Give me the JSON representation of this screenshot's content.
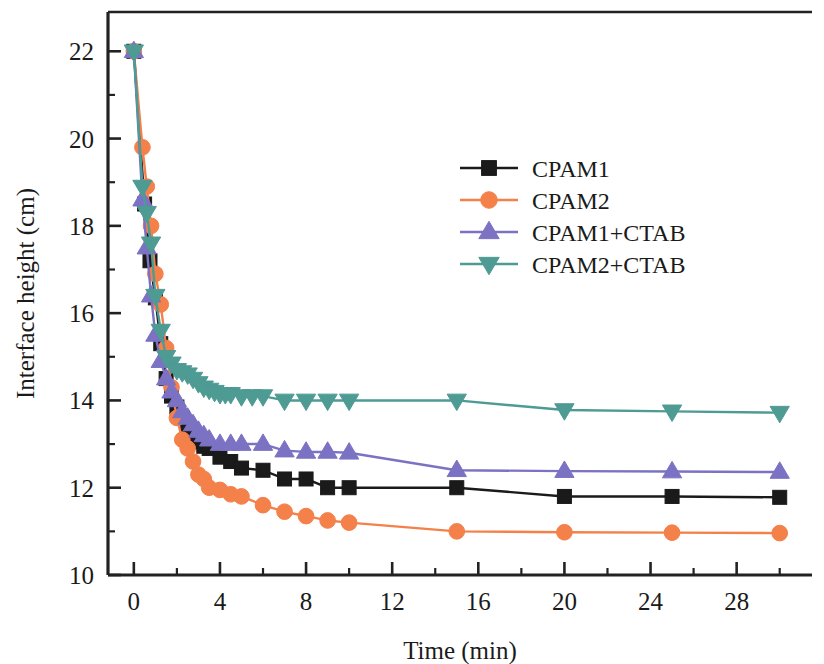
{
  "chart_data": {
    "type": "line",
    "title": "",
    "xlabel": "Time (min)",
    "ylabel": "Interface height (cm)",
    "xlim": [
      -1.2,
      31.5
    ],
    "ylim": [
      10,
      22.9
    ],
    "xticks": [
      0,
      4,
      8,
      12,
      16,
      20,
      24,
      28
    ],
    "yticks": [
      10,
      12,
      14,
      16,
      18,
      20,
      22
    ],
    "xtick_labels": [
      "0",
      "4",
      "8",
      "12",
      "16",
      "20",
      "24",
      "28"
    ],
    "ytick_labels": [
      "10",
      "12",
      "14",
      "16",
      "18",
      "20",
      "22"
    ],
    "xminor_step": 2,
    "yminor_step": 1,
    "grid": false,
    "legend_position": "upper center",
    "series": [
      {
        "name": "CPAM1",
        "color": "#1a1a1a",
        "marker": "square",
        "x": [
          0,
          0.5,
          0.75,
          1.0,
          1.25,
          1.5,
          1.75,
          2.0,
          2.25,
          2.5,
          2.75,
          3.0,
          3.25,
          3.5,
          4.0,
          4.5,
          5.0,
          6.0,
          7.0,
          8.0,
          9.0,
          10.0,
          15.0,
          20.0,
          25.0,
          30.0
        ],
        "y": [
          22.0,
          18.5,
          17.2,
          16.35,
          15.3,
          14.5,
          14.1,
          13.85,
          13.6,
          13.4,
          13.2,
          13.05,
          12.95,
          12.9,
          12.7,
          12.6,
          12.45,
          12.4,
          12.2,
          12.2,
          12.0,
          12.0,
          12.0,
          11.8,
          11.8,
          11.78
        ]
      },
      {
        "name": "CPAM2",
        "color": "#F4804A",
        "marker": "circle",
        "x": [
          0,
          0.4,
          0.6,
          0.8,
          1.0,
          1.25,
          1.5,
          1.75,
          2.0,
          2.25,
          2.5,
          2.75,
          3.0,
          3.25,
          3.5,
          4.0,
          4.5,
          5.0,
          6.0,
          7.0,
          8.0,
          9.0,
          10.0,
          15.0,
          20.0,
          25.0,
          30.0
        ],
        "y": [
          22.0,
          19.8,
          18.9,
          18.0,
          16.9,
          16.2,
          15.2,
          14.3,
          13.6,
          13.1,
          12.9,
          12.6,
          12.3,
          12.2,
          12.0,
          11.95,
          11.85,
          11.8,
          11.6,
          11.45,
          11.35,
          11.25,
          11.2,
          11.0,
          10.98,
          10.97,
          10.96
        ]
      },
      {
        "name": "CPAM1+CTAB",
        "color": "#7B72C4",
        "marker": "triangle-up",
        "x": [
          0,
          0.4,
          0.6,
          0.8,
          1.0,
          1.25,
          1.5,
          1.75,
          2.0,
          2.25,
          2.5,
          2.75,
          3.0,
          3.25,
          3.5,
          4.0,
          4.5,
          5.0,
          6.0,
          7.0,
          8.0,
          9.0,
          10.0,
          15.0,
          20.0,
          25.0,
          30.0
        ],
        "y": [
          22.0,
          18.6,
          17.5,
          16.4,
          15.5,
          14.9,
          14.5,
          14.2,
          14.0,
          13.75,
          13.6,
          13.45,
          13.3,
          13.2,
          13.1,
          13.0,
          13.0,
          13.0,
          13.0,
          12.85,
          12.82,
          12.82,
          12.8,
          12.4,
          12.38,
          12.37,
          12.36
        ]
      },
      {
        "name": "CPAM2+CTAB",
        "color": "#4E9B94",
        "marker": "triangle-down",
        "x": [
          0,
          0.4,
          0.6,
          0.8,
          1.0,
          1.25,
          1.5,
          1.75,
          2.0,
          2.25,
          2.5,
          2.75,
          3.0,
          3.25,
          3.5,
          3.75,
          4.0,
          4.25,
          4.5,
          5.0,
          5.5,
          6.0,
          7.0,
          8.0,
          9.0,
          10.0,
          15.0,
          20.0,
          25.0,
          30.0
        ],
        "y": [
          22.0,
          18.9,
          18.3,
          17.6,
          16.4,
          15.6,
          15.0,
          14.85,
          14.7,
          14.65,
          14.6,
          14.5,
          14.4,
          14.3,
          14.25,
          14.2,
          14.15,
          14.15,
          14.15,
          14.1,
          14.1,
          14.1,
          14.0,
          14.0,
          14.0,
          14.0,
          14.0,
          13.78,
          13.75,
          13.72
        ]
      }
    ]
  },
  "legend": {
    "items": [
      {
        "label": "CPAM1"
      },
      {
        "label": "CPAM2"
      },
      {
        "label": "CPAM1+CTAB"
      },
      {
        "label": "CPAM2+CTAB"
      }
    ]
  }
}
